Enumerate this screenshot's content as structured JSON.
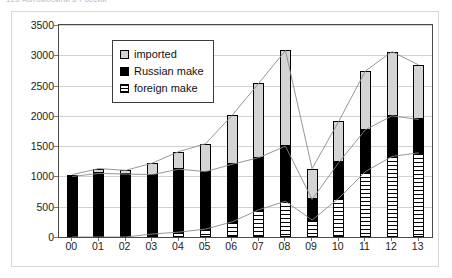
{
  "caption": {
    "text": "120   Автомобили в России"
  },
  "legend": {
    "position": "inside-top-left",
    "items": [
      {
        "label": "imported",
        "swatch": "imported-swatch",
        "color": "#d4d4d4"
      },
      {
        "label": "Russian make",
        "swatch": "russian-make-swatch",
        "color": "#000000"
      },
      {
        "label": "foreign make",
        "swatch": "foreign-make-swatch",
        "color": "#ffffff"
      }
    ]
  },
  "axes": {
    "y_ticks": [
      "0",
      "500",
      "1000",
      "1500",
      "2000",
      "2500",
      "3000",
      "3500"
    ],
    "x_ticks": [
      "00",
      "01",
      "02",
      "03",
      "04",
      "05",
      "06",
      "07",
      "08",
      "09",
      "10",
      "11",
      "12",
      "13"
    ]
  },
  "chart_data": {
    "type": "bar",
    "title": "",
    "subtitle": "",
    "xlabel": "",
    "ylabel": "",
    "stacked": true,
    "grid": true,
    "legend_position": "inside-top-left",
    "ylim": [
      0,
      3500
    ],
    "ytick_step": 500,
    "categories": [
      "00",
      "01",
      "02",
      "03",
      "04",
      "05",
      "06",
      "07",
      "08",
      "09",
      "10",
      "11",
      "12",
      "13"
    ],
    "series": [
      {
        "name": "foreign make",
        "color": "#ffffff",
        "pattern": "horizontal-hatch",
        "values": [
          0,
          0,
          0,
          50,
          80,
          130,
          250,
          450,
          590,
          280,
          640,
          1080,
          1330,
          1390
        ]
      },
      {
        "name": "Russian make",
        "color": "#000000",
        "pattern": "solid",
        "values": [
          1000,
          1050,
          1040,
          980,
          1040,
          950,
          950,
          860,
          910,
          340,
          590,
          690,
          670,
          550
        ]
      },
      {
        "name": "imported",
        "color": "#d4d4d4",
        "pattern": "solid",
        "values": [
          30,
          80,
          60,
          190,
          290,
          460,
          810,
          1230,
          1580,
          510,
          680,
          970,
          1060,
          900
        ]
      }
    ],
    "totals": [
      1030,
      1130,
      1100,
      1220,
      1410,
      1540,
      2010,
      2540,
      3080,
      1130,
      1910,
      2740,
      3060,
      2840
    ],
    "cumulative_foreign": [
      0,
      0,
      0,
      50,
      80,
      130,
      250,
      450,
      590,
      280,
      640,
      1080,
      1330,
      1390
    ],
    "cumulative_foreign_plus_russian": [
      1000,
      1050,
      1040,
      1030,
      1120,
      1080,
      1200,
      1310,
      1500,
      620,
      1230,
      1770,
      2000,
      1940
    ]
  },
  "colors": {
    "plot_border": "#4a4a4a",
    "gridline": "#d2d2d6",
    "card_border": "#d8d8dc",
    "connector_line": "#8a8a8e",
    "text": "#1c1c1c"
  }
}
